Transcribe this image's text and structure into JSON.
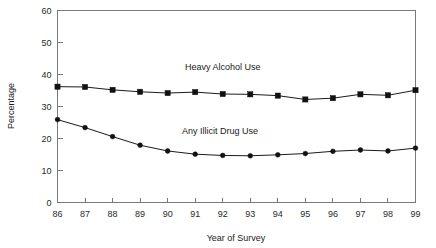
{
  "chart_data": {
    "type": "line",
    "title": "",
    "xlabel": "Year of Survey",
    "ylabel": "Percentage",
    "xlim": [
      86,
      99
    ],
    "ylim": [
      0,
      60
    ],
    "ytick_labels": [
      "60",
      "50",
      "40",
      "30",
      "20",
      "10",
      "0"
    ],
    "ytick_values": [
      60,
      50,
      40,
      30,
      20,
      10,
      0
    ],
    "grid": false,
    "legend": "inline-annotations",
    "categories": [
      "86",
      "87",
      "88",
      "89",
      "90",
      "91",
      "92",
      "93",
      "94",
      "95",
      "96",
      "97",
      "98",
      "99"
    ],
    "x": [
      86,
      87,
      88,
      89,
      90,
      91,
      92,
      93,
      94,
      95,
      96,
      97,
      98,
      99
    ],
    "series": [
      {
        "name": "Heavy Alcohol Use",
        "marker": "square",
        "label_x": 92,
        "label_y": 41.5,
        "values": [
          36.2,
          36.1,
          35.2,
          34.6,
          34.2,
          34.5,
          33.9,
          33.8,
          33.4,
          32.2,
          32.6,
          33.8,
          33.5,
          35.1
        ]
      },
      {
        "name": "Any Illicit Drug Use",
        "marker": "circle",
        "label_x": 91.9,
        "label_y": 21.5,
        "values": [
          25.9,
          23.4,
          20.6,
          17.9,
          16.1,
          15.1,
          14.7,
          14.6,
          14.9,
          15.3,
          16.0,
          16.4,
          16.1,
          17.0
        ]
      }
    ],
    "colors": {
      "line": "#1a1a1a",
      "marker": "#111111",
      "axis": "#7a7a7a",
      "background": "#ffffff"
    }
  }
}
